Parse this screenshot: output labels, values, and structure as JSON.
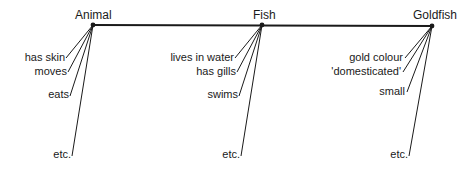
{
  "diagram": {
    "type": "hierarchy-chain",
    "nodes": [
      {
        "title": "Animal",
        "attributes": [
          "has skin",
          "moves",
          "eats",
          "etc."
        ]
      },
      {
        "title": "Fish",
        "attributes": [
          "lives in water",
          "has gills",
          "swims",
          "etc."
        ]
      },
      {
        "title": "Goldfish",
        "attributes": [
          "gold colour",
          "'domesticated'",
          "small",
          "etc."
        ]
      }
    ],
    "colors": {
      "line": "#1a1a1a",
      "background": "#ffffff"
    }
  }
}
